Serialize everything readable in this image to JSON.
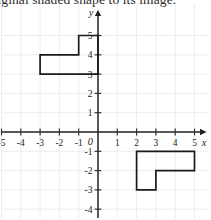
{
  "prompt": {
    "text": "original shaded shape to its image."
  },
  "chart_data": {
    "type": "scatter",
    "title": "",
    "subtitle": "",
    "xlabel": "x",
    "ylabel": "y",
    "origin_label": "0",
    "xlim": [
      -5.6,
      5.6
    ],
    "ylim": [
      -4.6,
      5.6
    ],
    "grid": true,
    "legend_position": "none",
    "x_ticks": [
      -5,
      -4,
      -3,
      -2,
      -1,
      1,
      2,
      3,
      4,
      5
    ],
    "y_ticks": [
      5,
      4,
      3,
      2,
      1,
      -1,
      -2,
      -3,
      -4
    ],
    "x_tick_labels": [
      "-5",
      "-4",
      "-3",
      "-2",
      "-1",
      "1",
      "2",
      "3",
      "4",
      "5"
    ],
    "y_tick_labels": [
      "5",
      "4",
      "3",
      "2",
      "1",
      "-1",
      "-2",
      "-3",
      "-4"
    ],
    "grid_x_lines": [
      -5,
      -4,
      -3,
      -2,
      -1,
      0,
      1,
      2,
      3,
      4,
      5
    ],
    "grid_y_lines": [
      5,
      4,
      3,
      2,
      1,
      0,
      -1,
      -2,
      -3,
      -4
    ],
    "series": [
      {
        "name": "preimage-polygon",
        "type": "polygon",
        "fill": "none",
        "stroke": "#1a1a1a",
        "points": [
          [
            -3,
            3
          ],
          [
            -3,
            4
          ],
          [
            -1,
            4
          ],
          [
            -1,
            5
          ],
          [
            0,
            5
          ],
          [
            0,
            3
          ]
        ]
      },
      {
        "name": "image-polygon",
        "type": "polygon",
        "fill": "none",
        "stroke": "#1a1a1a",
        "points": [
          [
            2,
            -1
          ],
          [
            5,
            -1
          ],
          [
            5,
            -2
          ],
          [
            3,
            -2
          ],
          [
            3,
            -3
          ],
          [
            2,
            -3
          ]
        ]
      }
    ],
    "colors": {
      "grid": "#e9e9ee",
      "axis": "#222222",
      "shape_stroke": "#1a1a1a",
      "text": "#1d1d1d"
    }
  }
}
